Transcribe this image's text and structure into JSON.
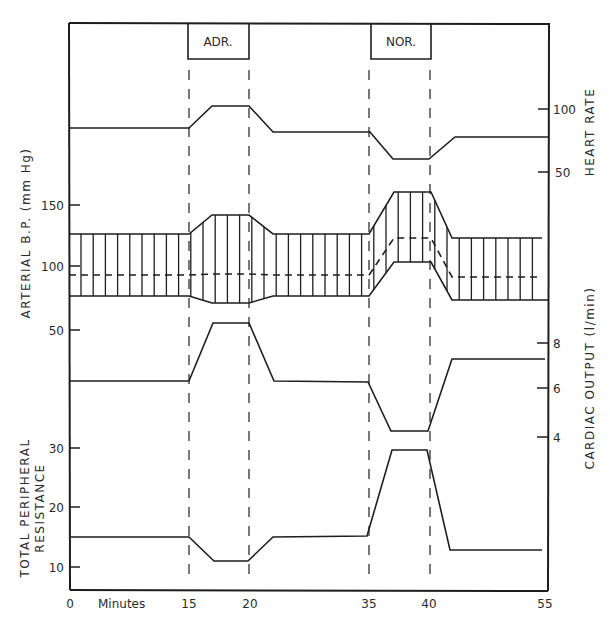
{
  "figure": {
    "markers": [
      {
        "label": "ADR.",
        "start_min": 15,
        "end_min": 20
      },
      {
        "label": "NOR.",
        "start_min": 35,
        "end_min": 40
      }
    ],
    "x_axis": {
      "title": "Minutes",
      "ticks": [
        "0",
        "15",
        "20",
        "35",
        "40",
        "55"
      ]
    },
    "left_axes": [
      {
        "title": "ARTERIAL B.P. (mm Hg)",
        "ticks": [
          "150",
          "100",
          "50"
        ]
      },
      {
        "title_line1": "TOTAL PERIPHERAL",
        "title_line2": "RESISTANCE",
        "ticks": [
          "30",
          "20",
          "10"
        ]
      }
    ],
    "right_axes": [
      {
        "title": "HEART RATE",
        "ticks": [
          "100",
          "50"
        ]
      },
      {
        "title": "CARDIAC OUTPUT (l/min)",
        "ticks": [
          "8",
          "6",
          "4"
        ]
      }
    ]
  },
  "chart_data": {
    "type": "line",
    "title": "",
    "xlabel": "Minutes",
    "x_ticks": [
      0,
      15,
      20,
      35,
      40,
      55
    ],
    "xlim": [
      0,
      55
    ],
    "grid": false,
    "legend": "none",
    "annotations": [
      {
        "text": "ADR.",
        "x_range": [
          15,
          20
        ],
        "note": "adrenaline infusion"
      },
      {
        "text": "NOR.",
        "x_range": [
          35,
          40
        ],
        "note": "noradrenaline infusion"
      }
    ],
    "panels": [
      {
        "name": "Heart Rate",
        "axis": "right",
        "ylabel": "HEART RATE",
        "y_ticks": [
          50,
          100
        ],
        "series": [
          {
            "name": "Heart rate",
            "x": [
              0,
              15,
              17,
              20,
              22,
              35,
              37,
              40,
              42,
              55
            ],
            "values": [
              78,
              78,
              95,
              95,
              75,
              75,
              52,
              52,
              72,
              72
            ]
          }
        ]
      },
      {
        "name": "Arterial Blood Pressure",
        "axis": "left",
        "ylabel": "ARTERIAL B.P. (mm Hg)",
        "y_ticks": [
          50,
          100,
          150
        ],
        "series": [
          {
            "name": "Systolic",
            "x": [
              0,
              15,
              17,
              20,
              22,
              35,
              37,
              40,
              42,
              55
            ],
            "values": [
              126,
              126,
              142,
              142,
              126,
              126,
              159,
              159,
              122,
              122
            ]
          },
          {
            "name": "Mean (dashed)",
            "x": [
              0,
              15,
              17,
              20,
              22,
              35,
              37,
              40,
              42,
              55
            ],
            "values": [
              92,
              92,
              93,
              93,
              92,
              92,
              122,
              122,
              91,
              91
            ]
          },
          {
            "name": "Diastolic",
            "x": [
              0,
              15,
              17,
              20,
              22,
              35,
              37,
              40,
              42,
              55
            ],
            "values": [
              75,
              75,
              69,
              69,
              75,
              75,
              105,
              105,
              72,
              72
            ]
          }
        ]
      },
      {
        "name": "Cardiac Output",
        "axis": "right",
        "ylabel": "CARDIAC OUTPUT (l/min)",
        "y_ticks": [
          4,
          6,
          8
        ],
        "series": [
          {
            "name": "Cardiac output",
            "x": [
              0,
              15,
              17,
              20,
              22,
              35,
              37,
              40,
              42,
              55
            ],
            "values": [
              6.3,
              6.3,
              8.9,
              8.9,
              6.3,
              6.3,
              4.3,
              4.3,
              7.2,
              7.2
            ]
          }
        ]
      },
      {
        "name": "Total Peripheral Resistance",
        "axis": "left",
        "ylabel": "TOTAL PERIPHERAL RESISTANCE",
        "y_ticks": [
          10,
          20,
          30
        ],
        "series": [
          {
            "name": "TPR",
            "x": [
              0,
              15,
              17,
              20,
              22,
              35,
              37,
              40,
              42,
              55
            ],
            "values": [
              15,
              15,
              11,
              11,
              15,
              15,
              29.7,
              29.7,
              12.7,
              12.7
            ]
          }
        ]
      }
    ]
  }
}
